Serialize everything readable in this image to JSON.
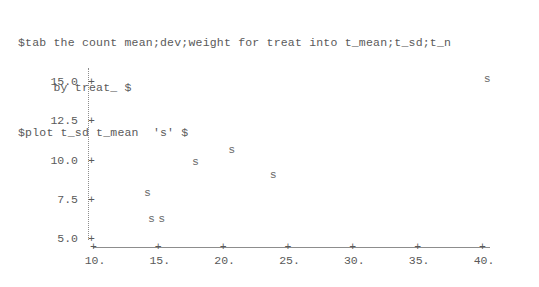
{
  "terminal": {
    "commands": [
      "$tab the count mean;dev;weight for treat into t_mean;t_sd;t_n",
      "     by treat_ $",
      "$plot t_sd t_mean  's' $"
    ],
    "line1": "$tab the count mean;dev;weight for treat into t_mean;t_sd;t_n",
    "line2": "     by treat_ $",
    "line3": "$plot t_sd t_mean  's' $"
  },
  "chart_data": {
    "type": "scatter",
    "title": "",
    "subtitle": "",
    "xlabel": "",
    "ylabel": "",
    "marker": "s",
    "grid": false,
    "legend": null,
    "xlim": [
      10,
      40
    ],
    "ylim": [
      5.0,
      15.0
    ],
    "xticks": [
      10,
      15,
      20,
      25,
      30,
      35,
      40
    ],
    "yticks": [
      5.0,
      7.5,
      10.0,
      12.5,
      15.0
    ],
    "xtick_labels": [
      "10.",
      "15.",
      "20.",
      "25.",
      "30.",
      "35.",
      "40."
    ],
    "ytick_labels": [
      "5.0",
      "7.5",
      "10.0",
      "12.5",
      "15.0"
    ],
    "tick_glyph": "+",
    "points": [
      {
        "x": 14.2,
        "y": 7.9,
        "label": "s"
      },
      {
        "x": 14.5,
        "y": 6.3,
        "label": "s"
      },
      {
        "x": 15.3,
        "y": 6.3,
        "label": "s"
      },
      {
        "x": 17.9,
        "y": 9.9,
        "label": "s"
      },
      {
        "x": 20.7,
        "y": 10.7,
        "label": "s"
      },
      {
        "x": 23.9,
        "y": 9.1,
        "label": "s"
      },
      {
        "x": 40.4,
        "y": 15.2,
        "label": "s"
      }
    ],
    "axis_color": "#8d8d8d",
    "text_color": "#5a5a5a",
    "marker_color": "#6b6b6b",
    "background": "#ffffff"
  }
}
